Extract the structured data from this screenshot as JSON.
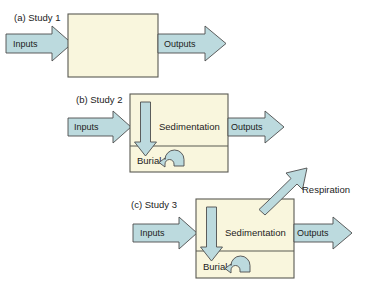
{
  "figure": {
    "type": "flow-diagram",
    "caption_style": "three stacked box-model panels",
    "background_color": "#ffffff",
    "colors": {
      "box_fill": "#f9f6dd",
      "box_stroke": "#5a5a52",
      "arrow_fill": "#bcdade",
      "arrow_stroke": "#4d4d4d",
      "text": "#1c1c1c"
    },
    "panels": [
      {
        "id": "panel-a",
        "label": "(a) Study 1",
        "box": {
          "x": 68,
          "y": 14,
          "width": 90,
          "height": 63,
          "divided": false
        },
        "inputs": {
          "label": "Inputs",
          "direction": "right"
        },
        "outputs": {
          "label": "Outputs",
          "direction": "right"
        },
        "internal_processes": [],
        "respiration": null
      },
      {
        "id": "panel-b",
        "label": "(b) Study 2",
        "box": {
          "x": 130,
          "y": 94,
          "width": 98,
          "height": 78,
          "divided": true,
          "divider_y": 146
        },
        "inputs": {
          "label": "Inputs",
          "direction": "right"
        },
        "outputs": {
          "label": "Outputs",
          "direction": "right"
        },
        "internal_processes": [
          {
            "name": "Sedimentation",
            "icon": "down-arrow-icon"
          },
          {
            "name": "Burial",
            "icon": "hook-arrow-icon"
          }
        ],
        "respiration": null
      },
      {
        "id": "panel-c",
        "label": "(c) Study 3",
        "box": {
          "x": 196,
          "y": 199,
          "width": 98,
          "height": 79,
          "divided": true,
          "divider_y": 251
        },
        "inputs": {
          "label": "Inputs",
          "direction": "right"
        },
        "outputs": {
          "label": "Outputs",
          "direction": "right"
        },
        "internal_processes": [
          {
            "name": "Sedimentation",
            "icon": "down-arrow-icon"
          },
          {
            "name": "Burial",
            "icon": "hook-arrow-icon"
          }
        ],
        "respiration": {
          "label": "Respiration",
          "icon": "diagonal-arrow-up-right-icon",
          "direction": "up-right"
        }
      }
    ]
  }
}
